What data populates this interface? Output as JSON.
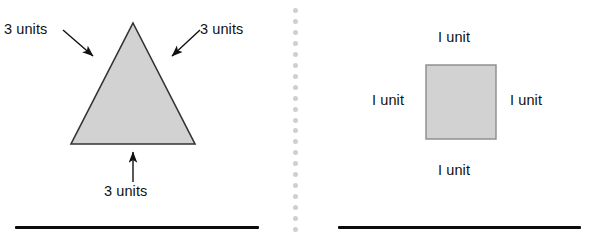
{
  "figure": {
    "background_color": "#ffffff",
    "shape_fill_color": "#d2d2d2",
    "shape_stroke_color": "#333333",
    "text_color": "#111111",
    "divider_dot_color": "#cfcfcf",
    "rule_color": "#0b0b0b"
  },
  "left_panel": {
    "shape": "equilateral-triangle",
    "labels": {
      "left_side": "3 units",
      "right_side": "3 units",
      "base": "3 units"
    }
  },
  "right_panel": {
    "shape": "square",
    "labels": {
      "top_side": "I unit",
      "left_side": "I unit",
      "right_side": "I unit",
      "bottom_side": "I unit"
    }
  },
  "divider": {
    "style": "dotted-vertical",
    "dot_count": 21
  },
  "rules": {
    "left": "horizontal-rule",
    "right": "horizontal-rule"
  }
}
